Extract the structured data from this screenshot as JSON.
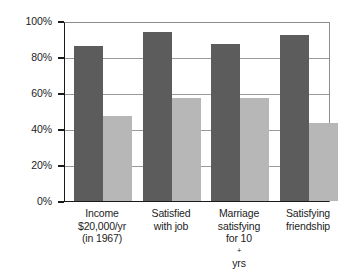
{
  "chart_data": {
    "type": "bar",
    "title": "",
    "subtitle": "",
    "xlabel": "",
    "ylabel": "",
    "ylim": [
      0,
      100
    ],
    "ytick_labels": [
      "100%",
      "80%",
      "60%",
      "40%",
      "20%",
      "0%"
    ],
    "ytick_values": [
      100,
      80,
      60,
      40,
      20,
      0
    ],
    "grid": true,
    "legend": "none",
    "categories": [
      "Income $20,000/yr (in 1967)",
      "Satisfied with job",
      "Marriage satisfying for 10+ yrs",
      "Satisfying friendship"
    ],
    "category_lines": [
      [
        "Income",
        "$20,000/yr",
        "(in 1967)"
      ],
      [
        "Satisfied",
        "with job"
      ],
      [
        "Marriage",
        "satisfying",
        "for 10+ yrs"
      ],
      [
        "Satisfying",
        "friendship"
      ]
    ],
    "series": [
      {
        "name": "dark",
        "color": "#5c5c5c",
        "values": [
          87,
          95,
          88,
          93
        ]
      },
      {
        "name": "light",
        "color": "#b7b7b7",
        "values": [
          48,
          58,
          58,
          44
        ]
      }
    ]
  },
  "axis": {
    "y_labels": [
      "100%",
      "80%",
      "60%",
      "40%",
      "20%",
      "0%"
    ]
  },
  "category_labels": {
    "g0_l0": "Income",
    "g0_l1": "$20,000/yr",
    "g0_l2": "(in 1967)",
    "g1_l0": "Satisfied",
    "g1_l1": "with job",
    "g2_l0": "Marriage",
    "g2_l1": "satisfying",
    "g2_l2a": "for 10",
    "g2_l2b": "+",
    "g2_l2c": " yrs",
    "g3_l0": "Satisfying",
    "g3_l1": "friendship"
  },
  "colors": {
    "dark_bar": "#5c5c5c",
    "light_bar": "#b7b7b7",
    "axis": "#1a1a1a",
    "grid": "#9a9a9a",
    "background": "#ffffff"
  }
}
